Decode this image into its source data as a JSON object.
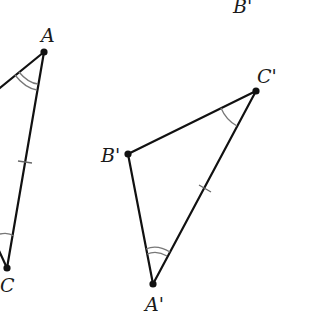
{
  "figure": {
    "labels": {
      "A": "A",
      "C": "C",
      "B_prime_top": "B'",
      "A_prime": "A'",
      "B_prime": "B'",
      "C_prime": "C'"
    },
    "colors": {
      "line": "#111111",
      "mark": "#777777",
      "background": "#ffffff"
    }
  }
}
